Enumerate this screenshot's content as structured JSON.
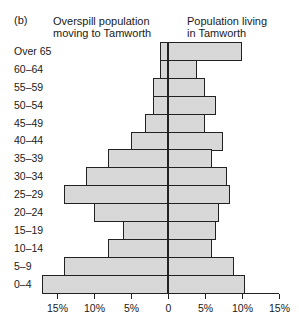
{
  "panel_label": "(b)",
  "headers": {
    "left_line1": "Overspill population",
    "left_line2": "moving to Tamworth",
    "right_line1": "Population living",
    "right_line2": "in Tamworth"
  },
  "chart_data": {
    "type": "bar",
    "subtype": "population pyramid (horizontal, back-to-back)",
    "title": "",
    "categories": [
      "Over 65",
      "60–64",
      "55–59",
      "50–54",
      "45–49",
      "40–44",
      "35–39",
      "30–34",
      "25–29",
      "20–24",
      "15–19",
      "10–14",
      "5–9",
      "0–4"
    ],
    "series": [
      {
        "name": "Overspill population moving to Tamworth",
        "side": "left",
        "values": [
          1,
          1,
          2,
          2,
          3,
          5,
          8,
          11,
          14,
          10,
          6,
          8,
          14,
          17
        ]
      },
      {
        "name": "Population living in Tamworth",
        "side": "right",
        "values": [
          10,
          4,
          5,
          6.5,
          5,
          7.5,
          6,
          8,
          8.5,
          7,
          6.5,
          6,
          9,
          10.5
        ]
      }
    ],
    "xlabel": "",
    "ylabel": "",
    "xticks": [
      "15%",
      "10%",
      "5%",
      "0",
      "5%",
      "10%",
      "15%"
    ],
    "xlim": [
      -15,
      15
    ],
    "unit": "%",
    "grid": false,
    "legend": "column headers above each side"
  }
}
